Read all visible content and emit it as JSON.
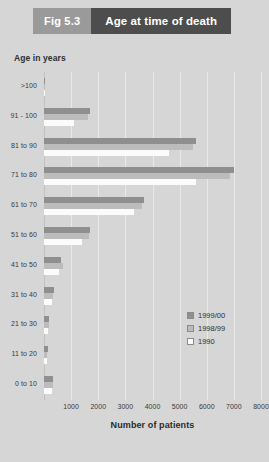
{
  "header": {
    "figure_label": "Fig 5.3",
    "title": "Age at time of death"
  },
  "legend": {
    "position": "inside-right",
    "entries": [
      {
        "label": "1999/00",
        "color": "#8f8f8f"
      },
      {
        "label": "1998/99",
        "color": "#bcbcbc"
      },
      {
        "label": "1990",
        "color": "#fbfbfb"
      }
    ]
  },
  "chart_data": {
    "type": "bar",
    "orientation": "horizontal",
    "title": "Age at time of death",
    "xlabel": "Number of patients",
    "ylabel": "Age in years",
    "xlim": [
      0,
      8000
    ],
    "xticks": [
      1000,
      2000,
      3000,
      4000,
      5000,
      6000,
      7000,
      8000
    ],
    "xtick_labels": [
      "1000",
      "2000",
      "3000",
      "4000",
      "5000",
      "6000",
      "7000",
      "8000"
    ],
    "grid": true,
    "categories": [
      ">100",
      "91 - 100",
      "81 to 90",
      "71 to 80",
      "61 to 70",
      "51 to 60",
      "41 to 50",
      "31 to 40",
      "21 to 30",
      "11 to 20",
      "0 to 10"
    ],
    "series": [
      {
        "name": "1999/00",
        "color": "#8f8f8f",
        "values": [
          20,
          1700,
          5600,
          7000,
          3700,
          1700,
          620,
          360,
          200,
          130,
          350
        ]
      },
      {
        "name": "1998/99",
        "color": "#bcbcbc",
        "values": [
          15,
          1620,
          5500,
          6850,
          3600,
          1650,
          700,
          330,
          180,
          110,
          320
        ]
      },
      {
        "name": "1990",
        "color": "#fbfbfb",
        "values": [
          10,
          1100,
          4600,
          5600,
          3300,
          1400,
          560,
          280,
          160,
          100,
          280
        ]
      }
    ]
  }
}
